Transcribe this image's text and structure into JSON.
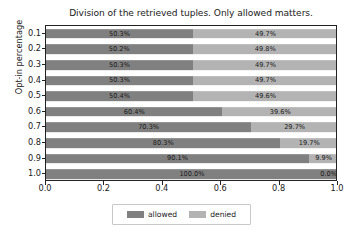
{
  "chart_data": {
    "type": "bar",
    "orientation": "horizontal",
    "stacked": true,
    "title": "Division of the retrieved tuples. Only allowed matters.",
    "xlabel": "",
    "ylabel": "Opt-in percentage",
    "xlim": [
      0.0,
      1.0
    ],
    "xticks": [
      "0.0",
      "0.2",
      "0.4",
      "0.6",
      "0.8",
      "1.0"
    ],
    "xtick_values": [
      0.0,
      0.2,
      0.4,
      0.6,
      0.8,
      1.0
    ],
    "categories": [
      "0.1",
      "0.2",
      "0.3",
      "0.4",
      "0.5",
      "0.6",
      "0.7",
      "0.8",
      "0.9",
      "1.0"
    ],
    "grid": false,
    "legend_position": "below-center",
    "series": [
      {
        "name": "allowed",
        "color": "#808080",
        "values": [
          0.503,
          0.502,
          0.503,
          0.503,
          0.504,
          0.604,
          0.703,
          0.803,
          0.901,
          1.0
        ],
        "labels": [
          "50.3%",
          "50.2%",
          "50.3%",
          "50.3%",
          "50.4%",
          "60.4%",
          "70.3%",
          "80.3%",
          "90.1%",
          "100.0%"
        ]
      },
      {
        "name": "denied",
        "color": "#b3b3b3",
        "values": [
          0.497,
          0.498,
          0.497,
          0.497,
          0.496,
          0.396,
          0.297,
          0.197,
          0.099,
          0.0
        ],
        "labels": [
          "49.7%",
          "49.8%",
          "49.7%",
          "49.7%",
          "49.6%",
          "39.6%",
          "29.7%",
          "19.7%",
          "9.9%",
          "0.0%"
        ]
      }
    ]
  },
  "legend": {
    "items": [
      {
        "label": "allowed",
        "color": "#808080"
      },
      {
        "label": "denied",
        "color": "#b3b3b3"
      }
    ]
  }
}
